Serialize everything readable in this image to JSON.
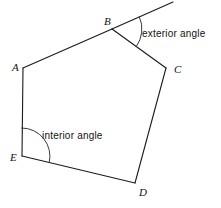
{
  "figure": {
    "background_color": "#ffffff",
    "line_color": "#1a1a1a",
    "arc_color": "#3a3a3a",
    "text_color": "#111111",
    "width": 221,
    "height": 208
  },
  "vertices": [
    {
      "id": "A",
      "label": "A",
      "x": 23,
      "y": 68,
      "label_x": 12,
      "label_y": 71
    },
    {
      "id": "B",
      "label": "B",
      "x": 112,
      "y": 29,
      "label_x": 104,
      "label_y": 25
    },
    {
      "id": "C",
      "label": "C",
      "x": 166,
      "y": 68,
      "label_x": 174,
      "label_y": 73
    },
    {
      "id": "D",
      "label": "D",
      "x": 135,
      "y": 183,
      "label_x": 139,
      "label_y": 196
    },
    {
      "id": "E",
      "label": "E",
      "x": 22,
      "y": 156,
      "label_x": 10,
      "label_y": 161
    }
  ],
  "edges": [
    {
      "from": "A",
      "to": "B"
    },
    {
      "from": "B",
      "to": "C"
    },
    {
      "from": "C",
      "to": "D"
    },
    {
      "from": "D",
      "to": "E"
    },
    {
      "from": "E",
      "to": "A"
    }
  ],
  "ray": {
    "name": "extension-of-AB-beyond-B",
    "from_x": 112,
    "from_y": 29,
    "to_x": 173,
    "to_y": 2
  },
  "annotations": {
    "exterior": {
      "text": "exterior  angle",
      "text_x": 142,
      "text_y": 37,
      "arc_center_x": 112,
      "arc_center_y": 29,
      "arc_radius": 30
    },
    "interior": {
      "text": "interior  angle",
      "text_x": 42,
      "text_y": 139,
      "arc_center_x": 22,
      "arc_center_y": 156,
      "arc_radius": 28
    }
  }
}
